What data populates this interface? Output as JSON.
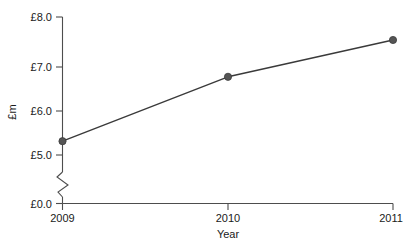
{
  "chart_data": {
    "type": "line",
    "title": "",
    "subtitle": "",
    "xlabel": "Year",
    "ylabel": "£m",
    "categories": [
      "2009",
      "2010",
      "2011"
    ],
    "x": [
      2009,
      2010,
      2011
    ],
    "series": [
      {
        "name": "",
        "values": [
          5.3,
          6.7,
          7.5
        ]
      }
    ],
    "values": [
      5.3,
      6.7,
      7.5
    ],
    "ylim": [
      5.0,
      8.0
    ],
    "y_tick_labels": [
      "£8.0",
      "£7.0",
      "£6.0",
      "£5.0",
      "£0.0"
    ],
    "y_tick_values": [
      8.0,
      7.0,
      6.0,
      5.0,
      0.0
    ],
    "x_tick_labels": [
      "2009",
      "2010",
      "2011"
    ],
    "grid": false,
    "legend": "none",
    "axis_break": true,
    "axis_break_between": [
      5.0,
      0.0
    ],
    "marker": "circle",
    "line_color": "#3a3a3a",
    "marker_color": "#555555",
    "axis_color": "#4d4d4d",
    "background_color": "#ffffff"
  },
  "labels": {
    "y_axis_title": "£m",
    "x_axis_title": "Year",
    "y_tick_8": "£8.0",
    "y_tick_7": "£7.0",
    "y_tick_6": "£6.0",
    "y_tick_5": "£5.0",
    "y_tick_0": "£0.0",
    "x_tick_2009": "2009",
    "x_tick_2010": "2010",
    "x_tick_2011": "2011"
  }
}
